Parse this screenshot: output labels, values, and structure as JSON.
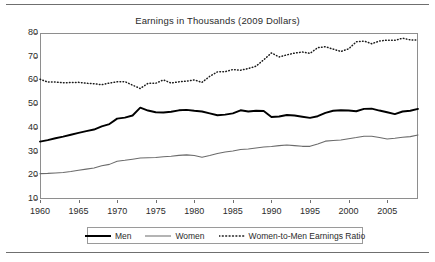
{
  "chart_data": {
    "type": "line",
    "title": "Earnings in Thousands (2009 Dollars)",
    "xlabel": "",
    "ylabel": "",
    "xlim": [
      1960,
      2009
    ],
    "ylim": [
      10,
      80
    ],
    "ytick_labels": [
      "80",
      "70",
      "60",
      "50",
      "40",
      "30",
      "20",
      "10"
    ],
    "yticks": [
      80,
      70,
      60,
      50,
      40,
      30,
      20,
      10
    ],
    "xtick_labels": [
      "1960",
      "1965",
      "1970",
      "1975",
      "1980",
      "1985",
      "1990",
      "1995",
      "2000",
      "2005"
    ],
    "xticks": [
      1960,
      1965,
      1970,
      1975,
      1980,
      1985,
      1990,
      1995,
      2000,
      2005
    ],
    "grid": false,
    "legend_position": "bottom-outside",
    "x": [
      1960,
      1961,
      1962,
      1963,
      1964,
      1965,
      1966,
      1967,
      1968,
      1969,
      1970,
      1971,
      1972,
      1973,
      1974,
      1975,
      1976,
      1977,
      1978,
      1979,
      1980,
      1981,
      1982,
      1983,
      1984,
      1985,
      1986,
      1987,
      1988,
      1989,
      1990,
      1991,
      1992,
      1993,
      1994,
      1995,
      1996,
      1997,
      1998,
      1999,
      2000,
      2001,
      2002,
      2003,
      2004,
      2005,
      2006,
      2007,
      2008,
      2009
    ],
    "series": [
      {
        "name": "Men",
        "style": "solid-thick",
        "color": "#000000",
        "values": [
          34.2,
          34.8,
          35.6,
          36.3,
          37.1,
          37.9,
          38.6,
          39.3,
          40.6,
          41.6,
          43.9,
          44.3,
          45.2,
          48.5,
          47.3,
          46.6,
          46.5,
          46.8,
          47.4,
          47.6,
          47.2,
          46.9,
          46.1,
          45.3,
          45.6,
          46.1,
          47.4,
          46.9,
          47.2,
          47.1,
          44.6,
          44.8,
          45.4,
          45.2,
          44.7,
          44.2,
          44.9,
          46.3,
          47.2,
          47.4,
          47.3,
          47.0,
          48.0,
          48.1,
          47.3,
          46.6,
          45.8,
          46.9,
          47.2,
          48.0
        ]
      },
      {
        "name": "Women",
        "style": "solid-thin",
        "color": "#6b6b6b",
        "values": [
          20.7,
          20.8,
          21.0,
          21.2,
          21.6,
          22.1,
          22.6,
          23.1,
          24.0,
          24.6,
          25.9,
          26.3,
          26.8,
          27.3,
          27.4,
          27.5,
          27.8,
          28.0,
          28.4,
          28.6,
          28.3,
          27.6,
          28.3,
          29.2,
          29.8,
          30.2,
          30.9,
          31.1,
          31.5,
          31.9,
          32.1,
          32.5,
          32.8,
          32.5,
          32.2,
          32.2,
          33.2,
          34.4,
          34.7,
          34.9,
          35.4,
          35.9,
          36.5,
          36.5,
          35.9,
          35.3,
          35.6,
          36.0,
          36.3,
          37.0
        ]
      },
      {
        "name": "Women-to-Men Earnings Ratio",
        "style": "dotted",
        "color": "#1a1a1a",
        "values": [
          60.5,
          59.3,
          59.3,
          59.0,
          59.1,
          59.2,
          58.8,
          58.6,
          58.2,
          58.9,
          59.4,
          59.5,
          58.0,
          56.6,
          58.8,
          58.8,
          60.2,
          58.9,
          59.4,
          59.7,
          60.2,
          59.2,
          61.7,
          63.6,
          63.7,
          64.6,
          64.3,
          65.0,
          66.0,
          68.7,
          71.6,
          69.9,
          70.8,
          71.5,
          72.0,
          71.4,
          73.8,
          74.2,
          73.2,
          72.2,
          73.3,
          76.3,
          76.6,
          75.5,
          76.6,
          77.0,
          76.9,
          77.8,
          77.1,
          77.0
        ]
      }
    ]
  },
  "legend": {
    "items": [
      {
        "label": "Men"
      },
      {
        "label": "Women"
      },
      {
        "label": "Women-to-Men Earnings Ratio"
      }
    ]
  }
}
